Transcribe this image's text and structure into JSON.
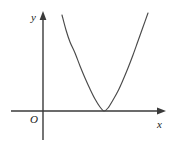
{
  "figure": {
    "title": "",
    "background_color": "#ffffff",
    "stroke_color": "#3a3a3a",
    "label_color": "#1a1a1a",
    "width": 176,
    "height": 148
  },
  "labels": {
    "y_axis": "y",
    "x_axis": "x",
    "origin": "O"
  },
  "chart_data": {
    "type": "line",
    "title": "",
    "xlabel": "x",
    "ylabel": "y",
    "grid": false,
    "legend": null,
    "annotations": [
      "O"
    ],
    "axes": {
      "x_axis_pixel_y": 111,
      "y_axis_pixel_x": 43,
      "x_axis_start_px": 11,
      "x_axis_end_px": 166,
      "y_axis_top_px": 11,
      "y_axis_bottom_px": 140,
      "origin_px": [
        43,
        111
      ],
      "arrowheads": [
        "x-positive",
        "y-positive"
      ]
    },
    "series": [
      {
        "name": "parabola",
        "shape": "upward parabola tangent to the x-axis",
        "vertex_px": [
          104,
          111
        ],
        "vertex_touches_x_axis": true,
        "opens": "up",
        "points_px": [
          [
            62,
            15
          ],
          [
            66,
            30
          ],
          [
            70,
            42
          ],
          [
            75,
            53
          ],
          [
            80,
            66
          ],
          [
            85,
            78
          ],
          [
            90,
            89
          ],
          [
            95,
            99
          ],
          [
            100,
            107
          ],
          [
            104,
            111
          ],
          [
            108,
            108
          ],
          [
            113,
            100
          ],
          [
            118,
            91
          ],
          [
            123,
            80
          ],
          [
            128,
            68
          ],
          [
            133,
            55
          ],
          [
            138,
            41
          ],
          [
            143,
            27
          ],
          [
            148,
            13
          ]
        ]
      }
    ],
    "xlim": [
      11,
      166
    ],
    "ylim": [
      140,
      11
    ]
  }
}
